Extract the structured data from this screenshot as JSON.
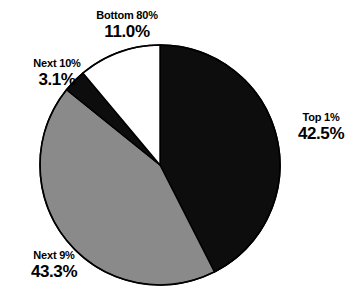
{
  "chart_data": {
    "type": "pie",
    "title": "",
    "subtitle": "",
    "xlabel": "",
    "ylabel": "",
    "legend_position": "none",
    "grid": false,
    "units": "percent",
    "total": 99.9,
    "start_angle_deg": 0,
    "direction": "clockwise",
    "categories": [
      "Top 1%",
      "Next 9%",
      "Next 10%",
      "Bottom 80%"
    ],
    "values": [
      42.5,
      43.3,
      3.1,
      11.0
    ],
    "value_labels": [
      "42.5%",
      "43.3%",
      "3.1%",
      "11.0%"
    ],
    "colors": [
      "#0d0d0d",
      "#8a8a8a",
      "#0d0d0d",
      "#ffffff"
    ],
    "slices": [
      {
        "name": "Top 1%",
        "value": 42.5,
        "value_label": "42.5%",
        "color": "#0d0d0d",
        "start_deg": 0.0,
        "end_deg": 153.0,
        "label_position": "right"
      },
      {
        "name": "Next 9%",
        "value": 43.3,
        "value_label": "43.3%",
        "color": "#8a8a8a",
        "start_deg": 153.0,
        "end_deg": 308.9,
        "label_position": "bottom-left"
      },
      {
        "name": "Next 10%",
        "value": 3.1,
        "value_label": "3.1%",
        "color": "#0d0d0d",
        "start_deg": 308.9,
        "end_deg": 320.0,
        "label_position": "left"
      },
      {
        "name": "Bottom 80%",
        "value": 11.0,
        "value_label": "11.0%",
        "color": "#ffffff",
        "start_deg": 320.0,
        "end_deg": 360.0,
        "label_position": "top"
      }
    ]
  },
  "style": {
    "background": "#ffffff",
    "outline": "#000000",
    "text": "#000000",
    "center_x": 160,
    "center_y": 165,
    "radius": 120
  }
}
